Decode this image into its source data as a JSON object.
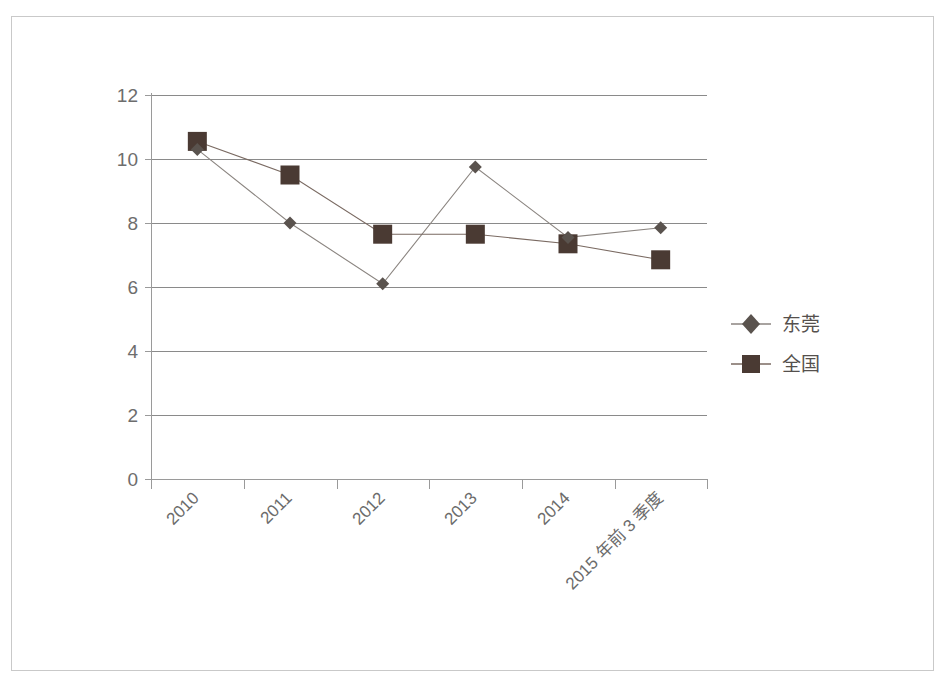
{
  "chart_data": {
    "type": "line",
    "title": "",
    "subtitle": "",
    "xlabel": "",
    "ylabel": "",
    "categories": [
      "2010",
      "2011",
      "2012",
      "2013",
      "2014",
      "2015 年前 3 季度"
    ],
    "series": [
      {
        "name": "东莞",
        "marker": "diamond",
        "color": "#5a534e",
        "values": [
          10.3,
          8.0,
          6.1,
          9.75,
          7.55,
          7.85
        ]
      },
      {
        "name": "全国",
        "marker": "square",
        "color": "#4a3a33",
        "values": [
          10.55,
          9.5,
          7.65,
          7.65,
          7.35,
          6.85
        ]
      }
    ],
    "yticks": [
      0,
      2,
      4,
      6,
      8,
      10,
      12
    ],
    "ytick_labels": [
      "0",
      "2",
      "4",
      "6",
      "8",
      "10",
      "12"
    ],
    "ylim": [
      0,
      12
    ],
    "grid": "horizontal",
    "legend_position": "right",
    "x_label_rotation": "-45"
  },
  "legend": {
    "items": [
      {
        "label": "东莞",
        "marker": "diamond-marker-icon",
        "color": "#5a534e"
      },
      {
        "label": "全国",
        "marker": "square-marker-icon",
        "color": "#4a3a33"
      }
    ]
  },
  "colors": {
    "gridline": "#8a8a8a",
    "axis": "#9a9a9a",
    "series_dongguan": "#5a534e",
    "series_national": "#4a3a33",
    "frame": "#c9c9c9",
    "tick_text": "#6d6d6d",
    "background": "#ffffff"
  }
}
